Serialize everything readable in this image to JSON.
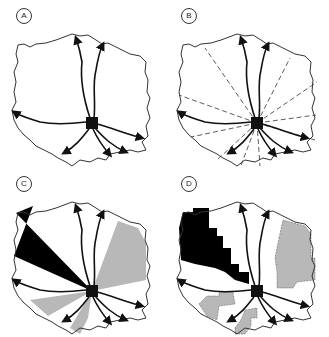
{
  "figure": {
    "panels": [
      {
        "id": "A",
        "label": "A",
        "description": "Catchment boundary with drainage channels radiating from central outlet"
      },
      {
        "id": "B",
        "label": "B",
        "description": "Catchment divided into radial sectors by dashed lines"
      },
      {
        "id": "C",
        "label": "C",
        "description": "Radial sectors shaded black and gray"
      },
      {
        "id": "D",
        "label": "D",
        "description": "Irregular grid-cell regions shaded black and gray"
      }
    ],
    "colors": {
      "outline": "#333333",
      "channel": "#111111",
      "black_fill": "#000000",
      "gray_fill": "#b8b8b8"
    }
  }
}
